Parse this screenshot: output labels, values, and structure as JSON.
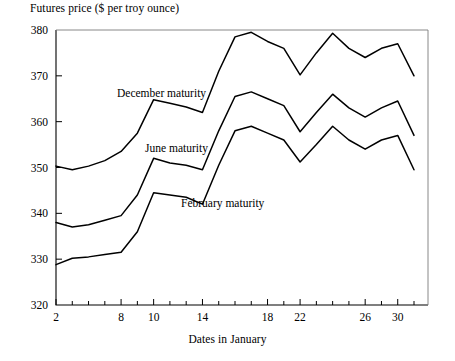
{
  "chart_data": {
    "type": "line",
    "title": "",
    "ylabel": "Futures price ($ per troy ounce)",
    "xlabel": "Dates in January",
    "ylim": [
      320,
      380
    ],
    "ytick_labels": [
      "320",
      "330",
      "340",
      "350",
      "360",
      "370",
      "380"
    ],
    "yticks": [
      320,
      330,
      340,
      350,
      360,
      370,
      380
    ],
    "xtick_labels": [
      "2",
      "8",
      "10",
      "14",
      "18",
      "22",
      "26",
      "30"
    ],
    "xticks": [
      2,
      8,
      10,
      14,
      18,
      22,
      26,
      30
    ],
    "x": [
      2,
      3,
      4,
      5,
      8,
      9,
      10,
      11,
      12,
      14,
      15,
      16,
      17,
      18,
      19,
      22,
      23,
      24,
      25,
      26,
      29,
      30,
      31
    ],
    "grid": false,
    "legend_position": "inline-annotations",
    "series": [
      {
        "name": "December maturity",
        "label": "December maturity",
        "color": "#000000",
        "values": [
          350.3,
          349.5,
          350.3,
          351.5,
          353.5,
          357.5,
          364.8,
          364.0,
          363.2,
          362.0,
          371.0,
          378.5,
          379.5,
          377.5,
          376.0,
          370.2,
          375.0,
          379.3,
          376.0,
          374.0,
          376.0,
          377.0,
          370.0
        ]
      },
      {
        "name": "June maturity",
        "label": "June maturity",
        "color": "#000000",
        "values": [
          338.0,
          337.0,
          337.5,
          338.5,
          339.5,
          344.0,
          352.0,
          351.0,
          350.5,
          349.5,
          358.0,
          365.5,
          366.5,
          365.0,
          363.5,
          357.8,
          362.0,
          366.0,
          363.0,
          361.0,
          363.0,
          364.5,
          357.0
        ]
      },
      {
        "name": "February maturity",
        "label": "February maturity",
        "color": "#000000",
        "values": [
          328.8,
          330.2,
          330.5,
          331.0,
          331.5,
          336.0,
          344.5,
          344.0,
          343.5,
          342.0,
          350.5,
          358.0,
          359.0,
          357.5,
          356.0,
          351.2,
          355.0,
          359.0,
          356.0,
          354.0,
          356.0,
          357.0,
          349.5
        ]
      }
    ],
    "annotations": [
      {
        "text": "December maturity",
        "x": 117,
        "y": 97
      },
      {
        "text": "June maturity",
        "x": 145,
        "y": 152
      },
      {
        "text": "February maturity",
        "x": 181,
        "y": 207
      }
    ]
  }
}
